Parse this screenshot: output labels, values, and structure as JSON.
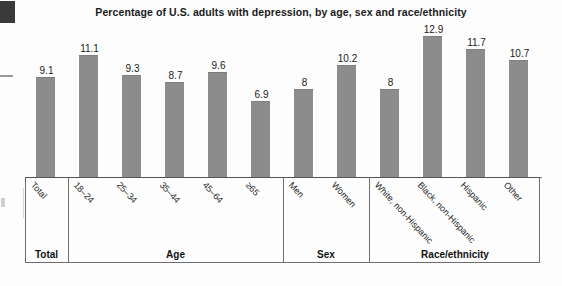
{
  "chart_data": {
    "type": "bar",
    "title": "Percentage of U.S. adults with depression, by age, sex and race/ethnicity",
    "xlabel": "",
    "ylabel": "",
    "ylim": [
      0,
      14
    ],
    "grid": false,
    "legend": "none",
    "bar_color": "#8c8c8c",
    "categories": [
      "Total",
      "18–24",
      "25–34",
      "35–44",
      "45–64",
      "≥65",
      "Men",
      "Women",
      "White, non-Hispanic",
      "Black, non-Hispanic",
      "Hispanic",
      "Other"
    ],
    "values": [
      9.1,
      11.1,
      9.3,
      8.7,
      9.6,
      6.9,
      8,
      10.2,
      8,
      12.9,
      11.7,
      10.7
    ],
    "value_labels": [
      "9.1",
      "11.1",
      "9.3",
      "8.7",
      "9.6",
      "6.9",
      "8",
      "10.2",
      "8",
      "12.9",
      "11.7",
      "10.7"
    ],
    "groups": [
      {
        "label": "Total",
        "count": 1
      },
      {
        "label": "Age",
        "count": 5
      },
      {
        "label": "Sex",
        "count": 2
      },
      {
        "label": "Race/ethnicity",
        "count": 4
      }
    ]
  },
  "artifacts": {
    "corner_block": "scan-artifact-block",
    "left_tick": "scan-artifact-tick"
  }
}
